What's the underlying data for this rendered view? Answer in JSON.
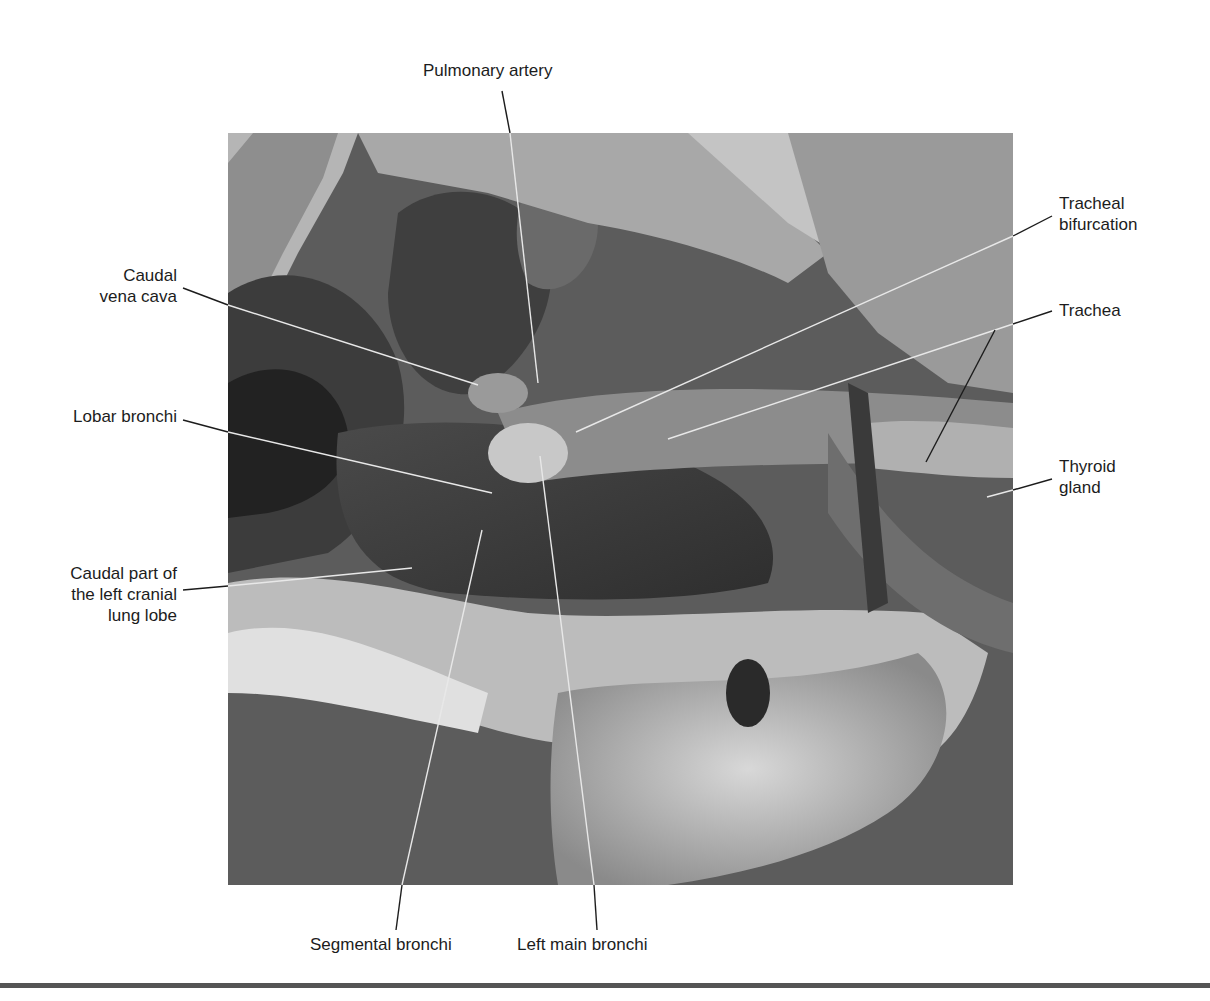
{
  "figure": {
    "type": "labeled anatomical photograph (grayscale)",
    "labels": {
      "pulmonary_artery": {
        "lines": [
          "Pulmonary artery"
        ]
      },
      "tracheal_bifurcation": {
        "lines": [
          "Tracheal",
          "bifurcation"
        ]
      },
      "caudal_vena_cava": {
        "lines": [
          "Caudal",
          "vena cava"
        ]
      },
      "trachea": {
        "lines": [
          "Trachea"
        ]
      },
      "lobar_bronchi": {
        "lines": [
          "Lobar bronchi"
        ]
      },
      "thyroid_gland": {
        "lines": [
          "Thyroid",
          "gland"
        ]
      },
      "caudal_part_left_cranial_lobe": {
        "lines": [
          "Caudal part of",
          "the left cranial",
          "lung lobe"
        ]
      },
      "segmental_bronchi": {
        "lines": [
          "Segmental bronchi"
        ]
      },
      "left_main_bronchi": {
        "lines": [
          "Left main bronchi"
        ]
      }
    },
    "colors": {
      "text": "#1c1c1c",
      "leader_line_dark": "#1c1c1c",
      "leader_line_on_photo": "#e8e8e8",
      "rule": "#555555",
      "photo_background": "#5a5a5a"
    }
  }
}
